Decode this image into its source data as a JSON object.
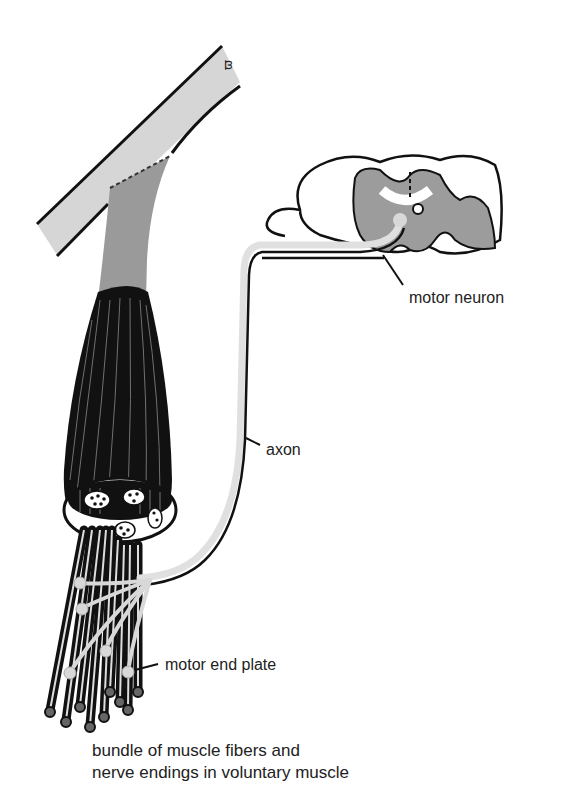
{
  "diagram": {
    "type": "anatomical illustration",
    "colors": {
      "bone": "#d6d6d6",
      "tendon": "#9a9a9a",
      "muscle": "#111111",
      "gray_matter": "#9c9c9c",
      "axon": "#e0e0e0",
      "outline": "#111111"
    }
  },
  "labels": {
    "motor_neuron": "motor neuron",
    "axon": "axon",
    "motor_end_plate": "motor end plate"
  },
  "caption": {
    "line1": "bundle of muscle fibers and",
    "line2": "nerve endings in voluntary muscle"
  }
}
